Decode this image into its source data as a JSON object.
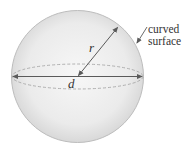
{
  "diagram": {
    "labels": {
      "radius": "r",
      "diameter": "d",
      "callout_line1": "curved",
      "callout_line2": "surface"
    },
    "colors": {
      "sphere_fill_center": "#f4f4f4",
      "sphere_fill_edge": "#d6d6d6",
      "outline": "#b5b5b5",
      "dashed_equator": "#a8a8a8",
      "dimension_lines": "#5a5a5a",
      "text": "#333333"
    }
  }
}
